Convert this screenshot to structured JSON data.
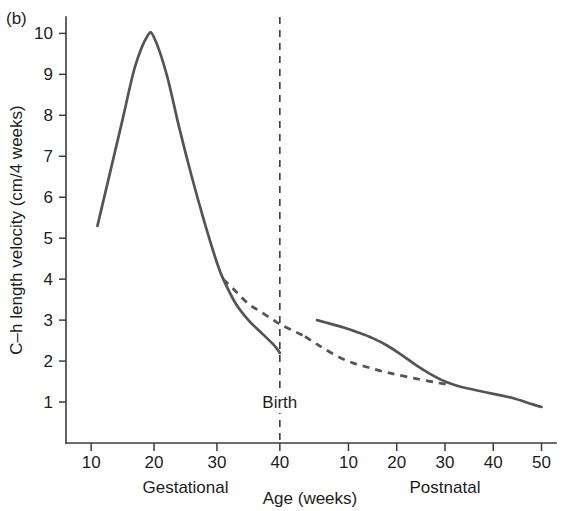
{
  "figure": {
    "panel_label": "(b)"
  },
  "chart_data": {
    "type": "line",
    "title": "",
    "xlabel": "Age (weeks)",
    "ylabel": "C–h length velocity (cm/4 weeks)",
    "grid": false,
    "legend": "none",
    "ylim": [
      0,
      10.4
    ],
    "yticks": [
      1,
      2,
      3,
      4,
      5,
      6,
      7,
      8,
      9,
      10
    ],
    "ytick_labels": [
      "1",
      "2",
      "3",
      "4",
      "5",
      "6",
      "7",
      "8",
      "9",
      "10"
    ],
    "x_segments": [
      {
        "name": "Gestational",
        "label": "Gestational",
        "ticks": [
          10,
          20,
          30,
          40
        ],
        "tick_labels": [
          "10",
          "20",
          "30",
          "40"
        ],
        "xlim": [
          6,
          44
        ]
      },
      {
        "name": "Postnatal",
        "label": "Postnatal",
        "ticks": [
          10,
          20,
          30,
          40,
          50
        ],
        "tick_labels": [
          "10",
          "20",
          "30",
          "40",
          "50"
        ],
        "xlim": [
          1,
          53
        ]
      }
    ],
    "annotations": [
      {
        "name": "birth-marker",
        "text": "Birth",
        "segment": "Gestational",
        "x": 40,
        "style": "vertical-dashed-line"
      }
    ],
    "series": [
      {
        "name": "gestational-velocity-solid",
        "label": "Gestational C–h length velocity",
        "segment": "Gestational",
        "style": "solid",
        "x": [
          11,
          13,
          15,
          17,
          19,
          20,
          22,
          24,
          26,
          28,
          30,
          31,
          33,
          35,
          37,
          39,
          40
        ],
        "y": [
          5.3,
          6.6,
          7.9,
          9.2,
          9.95,
          9.9,
          9.0,
          7.7,
          6.5,
          5.4,
          4.4,
          4.0,
          3.4,
          3.0,
          2.7,
          2.4,
          2.2
        ]
      },
      {
        "name": "gestational-velocity-dashed",
        "label": "Projected gestational trend",
        "segment": "Gestational",
        "style": "dashed",
        "x": [
          31,
          33,
          35,
          37,
          39,
          40,
          42,
          44
        ],
        "y": [
          4.0,
          3.7,
          3.4,
          3.2,
          3.0,
          2.9,
          2.75,
          2.6
        ]
      },
      {
        "name": "postnatal-velocity-dashed",
        "label": "Projected postnatal trend",
        "segment": "Postnatal",
        "style": "dashed",
        "x": [
          1,
          3,
          5,
          8,
          11,
          14,
          17,
          20,
          24,
          28,
          31
        ],
        "y": [
          2.6,
          2.45,
          2.3,
          2.1,
          1.95,
          1.85,
          1.75,
          1.67,
          1.57,
          1.48,
          1.42
        ]
      },
      {
        "name": "postnatal-velocity-solid",
        "label": "Postnatal C–h length velocity",
        "segment": "Postnatal",
        "style": "solid",
        "x": [
          3.5,
          6,
          9,
          12,
          15,
          18,
          21,
          24,
          27,
          30,
          33,
          36,
          40,
          44,
          48,
          50
        ],
        "y": [
          3.0,
          2.92,
          2.82,
          2.7,
          2.56,
          2.38,
          2.15,
          1.9,
          1.68,
          1.5,
          1.38,
          1.3,
          1.2,
          1.1,
          0.95,
          0.88
        ]
      }
    ]
  },
  "layout": {
    "plot_left": 66,
    "plot_right": 556,
    "plot_top": 17,
    "plot_bottom": 443,
    "segment_split": 305
  }
}
